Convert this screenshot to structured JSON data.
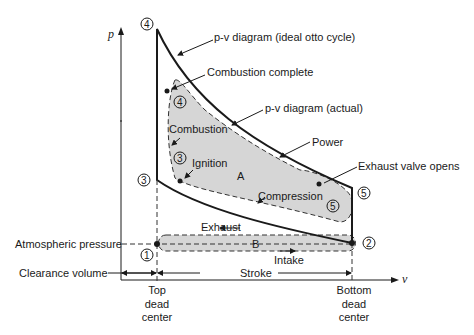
{
  "diagram": {
    "axes": {
      "y_label": "p",
      "x_label": "v"
    },
    "labels": {
      "ideal": "p-v diagram (ideal otto cycle)",
      "actual": "p-v diagram (actual)",
      "combustion_complete": "Combustion complete",
      "combustion": "Combustion",
      "ignition": "Ignition",
      "power": "Power",
      "exhaust_valve_opens": "Exhaust valve opens",
      "compression": "Compression",
      "exhaust": "Exhaust",
      "intake": "Intake",
      "area_a": "A",
      "area_b": "B",
      "atmospheric_pressure": "Atmospheric pressure",
      "clearance_volume": "Clearance volume",
      "stroke": "Stroke",
      "tdc_1": "Top",
      "tdc_2": "dead",
      "tdc_3": "center",
      "bdc_1": "Bottom",
      "bdc_2": "dead",
      "bdc_3": "center"
    },
    "points": {
      "p1": "1",
      "p2": "2",
      "p3": "3",
      "p4": "4",
      "p5": "5",
      "a3": "3",
      "a4": "4",
      "a5": "5"
    },
    "colors": {
      "line": "#1a1a1a",
      "fill": "#d6d6d6"
    }
  }
}
